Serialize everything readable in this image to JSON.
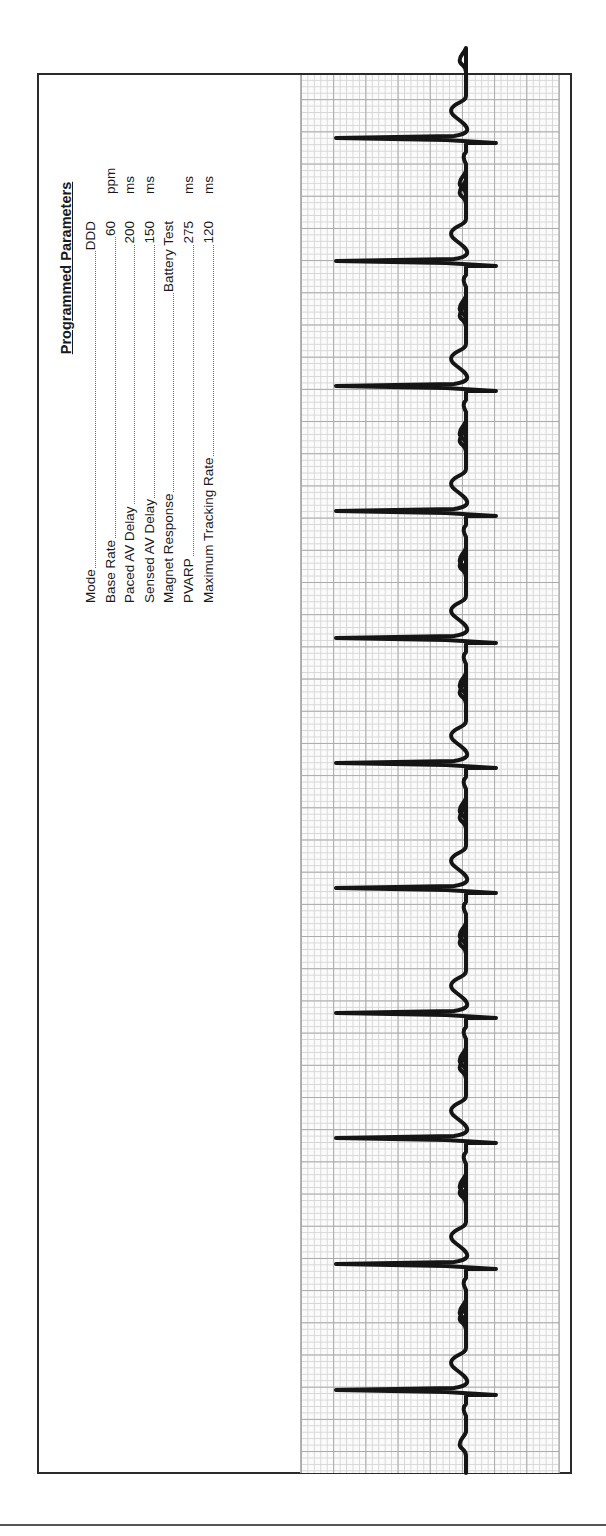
{
  "document": {
    "type": "pacemaker ECG rhythm strip",
    "orientation": "rotated 90deg counter-clockwise"
  },
  "parameters": {
    "title": "Programmed Parameters",
    "rows": [
      {
        "label": "Mode",
        "value": "DDD",
        "unit": ""
      },
      {
        "label": "Base Rate",
        "value": "60",
        "unit": "ppm"
      },
      {
        "label": "Paced AV Delay",
        "value": "200",
        "unit": "ms"
      },
      {
        "label": "Sensed AV Delay",
        "value": "150",
        "unit": "ms"
      },
      {
        "label": "Magnet Response",
        "value": "Battery Test",
        "unit": ""
      },
      {
        "label": "PVARP",
        "value": "275",
        "unit": "ms"
      },
      {
        "label": "Maximum Tracking Rate",
        "value": "120",
        "unit": "ms"
      }
    ]
  },
  "ecg": {
    "beat_count": 11,
    "beat_positions_y": [
      140,
      263,
      388,
      513,
      640,
      765,
      890,
      1015,
      1140,
      1266,
      1392
    ],
    "baseline_x": 466,
    "spike_min_x": 336,
    "spike_max_x": 496,
    "colors": {
      "trace": "#151515",
      "grid_major": "#a9a9a9",
      "grid_minor": "#d6d6d6",
      "frame": "#2a2a2a"
    }
  }
}
